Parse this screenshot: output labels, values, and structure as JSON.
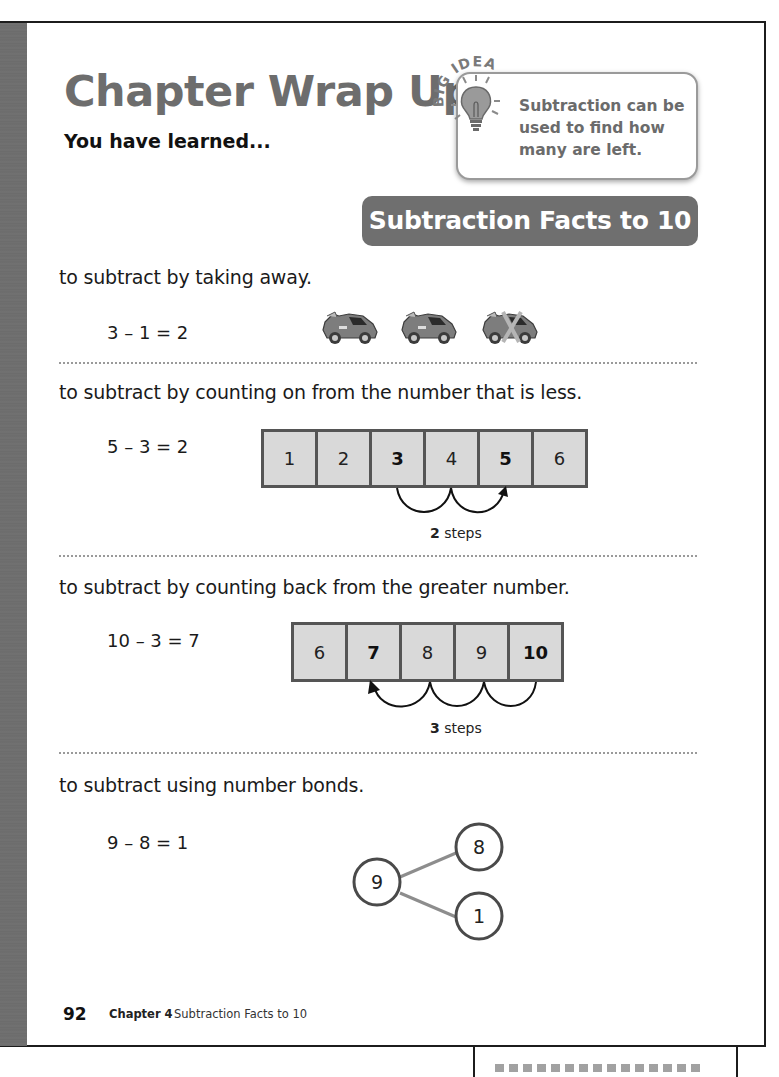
{
  "header": {
    "title": "Chapter Wrap Up",
    "subtitle": "You have learned..."
  },
  "big_idea": {
    "label": "BIG IDEA",
    "icon": "lightbulb-icon",
    "text_line1": "Subtraction can be",
    "text_line2": "used to find how",
    "text_line3": "many are left."
  },
  "banner": {
    "label": "Subtraction Facts to 10"
  },
  "sections": [
    {
      "text": "to subtract by taking away.",
      "equation": "3 – 1 = 2",
      "visual": "cars",
      "cars": [
        {
          "icon": "toy-car-icon",
          "crossed_out": false
        },
        {
          "icon": "toy-car-icon",
          "crossed_out": false
        },
        {
          "icon": "toy-car-icon",
          "crossed_out": true
        }
      ]
    },
    {
      "text": "to subtract by counting on from the number that is less.",
      "equation": "5 – 3 = 2",
      "visual": "number-line",
      "cells": [
        {
          "value": "1",
          "bold": false
        },
        {
          "value": "2",
          "bold": false
        },
        {
          "value": "3",
          "bold": true
        },
        {
          "value": "4",
          "bold": false
        },
        {
          "value": "5",
          "bold": true
        },
        {
          "value": "6",
          "bold": false
        }
      ],
      "steps_count": "2",
      "steps_label": "steps",
      "direction": "forward"
    },
    {
      "text": "to subtract by counting back from the greater number.",
      "equation": "10 – 3 = 7",
      "visual": "number-line",
      "cells": [
        {
          "value": "6",
          "bold": false
        },
        {
          "value": "7",
          "bold": true
        },
        {
          "value": "8",
          "bold": false
        },
        {
          "value": "9",
          "bold": false
        },
        {
          "value": "10",
          "bold": true
        }
      ],
      "steps_count": "3",
      "steps_label": "steps",
      "direction": "backward"
    },
    {
      "text": "to subtract using number bonds.",
      "equation": "9 – 8 = 1",
      "visual": "number-bond",
      "bond": {
        "whole": "9",
        "part1": "8",
        "part2": "1"
      }
    }
  ],
  "footer": {
    "page_number": "92",
    "chapter": "Chapter 4",
    "chapter_title": "Subtraction Facts to 10"
  },
  "colors": {
    "title_gray": "#6d6d6d",
    "banner_bg": "#6f6f6f",
    "cell_fill": "#d9d9d9",
    "cell_border": "#555555",
    "sidebar": "#6e6e6e"
  }
}
